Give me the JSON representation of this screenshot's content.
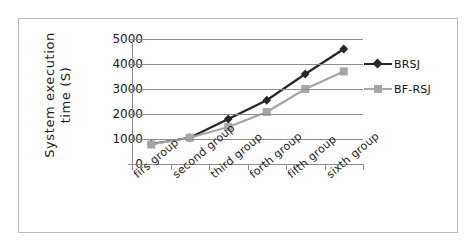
{
  "chart_data": {
    "type": "line",
    "title": "",
    "xlabel": "",
    "ylabel": "System execution time (S)",
    "ylabel_line1": "System execution",
    "ylabel_line2": "time (S)",
    "categories": [
      "firs group",
      "second group",
      "third group",
      "forth group",
      "fifth group",
      "sixth group"
    ],
    "ylim": [
      0,
      5000
    ],
    "yticks": [
      0,
      1000,
      2000,
      3000,
      4000,
      5000
    ],
    "ytick_labels": [
      "0",
      "1000",
      "2000",
      "3000",
      "4000",
      "5000"
    ],
    "grid": true,
    "grid_axis": "y",
    "legend_position": "right",
    "series": [
      {
        "name": "BRSJ",
        "values": [
          800,
          1050,
          1800,
          2550,
          3600,
          4600
        ],
        "color": "#262626",
        "marker": "diamond"
      },
      {
        "name": "BF-RSJ",
        "values": [
          780,
          1050,
          1480,
          2080,
          3000,
          3700
        ],
        "color": "#a6a6a6",
        "marker": "square"
      }
    ]
  },
  "colors": {
    "frame_border": "#b9b9b9",
    "axis": "#8d8d8d",
    "gridline": "#8d8d8d",
    "text": "#1a1a1a",
    "background": "#ffffff"
  }
}
